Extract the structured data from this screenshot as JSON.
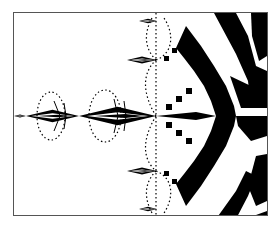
{
  "figure": {
    "type": "fractal-plot",
    "colors": {
      "fill": "#000000",
      "background": "#ffffff",
      "frame": "#555555"
    }
  },
  "caption": {
    "text": ""
  }
}
